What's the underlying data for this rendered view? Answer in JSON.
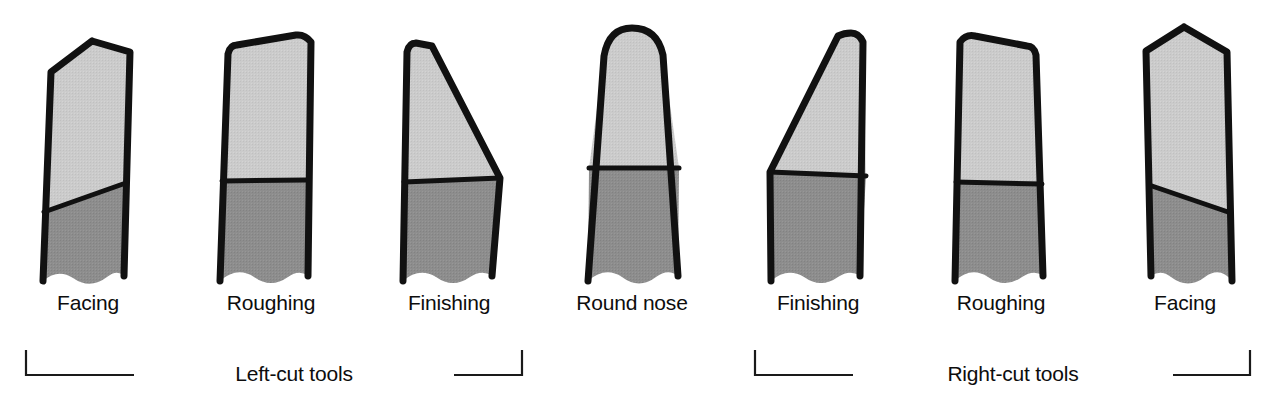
{
  "figure": {
    "background": "#ffffff",
    "outline_color": "#111111",
    "carbide_tip_color": "#c9c9c9",
    "shank_color": "#8d8d8d",
    "bracket_color": "#1a1a1a"
  },
  "tools": [
    {
      "id": "tool-1",
      "label": "Facing",
      "hand": "left-cut",
      "label_center_x": 88,
      "label_y": 291,
      "tip_path": "M 92 41 L 51 72 L 44 212 L 123 184 L 130 52 Z",
      "shank_path": "M 44 212 L 43 281 Q 58 268 73 278 Q 90 290 107 277 Q 117 269 124 276 L 123 184 Z",
      "outline_path": "M 92 41 L 51 72 L 43 281 M 92 41 L 130 52 L 124 276",
      "split_path": "M 44 212 L 123 184"
    },
    {
      "id": "tool-2",
      "label": "Roughing",
      "hand": "left-cut",
      "label_center_x": 271,
      "label_y": 291,
      "tip_path": "M 237 45 Q 230 45 228 54 L 222 181 L 307 180 L 311 42 Q 305 34 296 35 Z",
      "shank_path": "M 222 181 L 220 281 Q 237 266 254 277 Q 271 289 288 277 Q 299 269 308 276 L 307 180 Z",
      "outline_path": "M 237 45 Q 230 45 228 54 L 220 281 M 237 45 L 296 35 Q 305 34 311 42 L 308 276",
      "split_path": "M 222 181 L 307 180"
    },
    {
      "id": "tool-3",
      "label": "Finishing",
      "hand": "left-cut",
      "label_center_x": 449,
      "label_y": 291,
      "tip_path": "M 416 43 Q 409 43 407 52 L 404 182 L 500 178 L 432 46 Z",
      "shank_path": "M 404 182 L 403 281 Q 419 267 436 277 Q 453 289 470 277 Q 482 269 492 276 L 500 178 Z",
      "outline_path": "M 416 43 Q 409 43 407 52 L 403 281 M 416 43 L 432 46 L 500 178 L 492 276",
      "split_path": "M 404 182 L 500 178"
    },
    {
      "id": "tool-4",
      "label": "Round nose",
      "hand": "round-nose",
      "label_center_x": 632,
      "label_y": 291,
      "tip_path": "M 632 28 Q 609 28 604 56 L 589 168 L 679 168 L 663 55 Q 657 28 632 28 Z",
      "shank_path": "M 589 168 L 588 281 Q 605 266 622 277 Q 639 290 656 277 Q 668 268 678 276 L 679 168 Z",
      "outline_path": "M 632 28 Q 609 28 604 56 L 588 281 M 632 28 Q 657 28 663 55 L 678 276",
      "split_path": "M 589 168 L 679 168"
    },
    {
      "id": "tool-5",
      "label": "Finishing",
      "hand": "right-cut",
      "label_center_x": 818,
      "label_y": 291,
      "tip_path": "M 851 33 Q 844 33 838 36 L 770 172 L 866 176 L 863 42 Q 859 33 851 33 Z",
      "shank_path": "M 770 172 L 771 281 Q 787 267 804 277 Q 821 289 838 277 Q 850 269 860 276 L 866 176 Z",
      "outline_path": "M 851 33 Q 844 33 838 36 L 770 172 L 771 281 M 851 33 Q 859 33 863 42 L 860 276",
      "split_path": "M 770 172 L 866 176"
    },
    {
      "id": "tool-6",
      "label": "Roughing",
      "hand": "right-cut",
      "label_center_x": 1001,
      "label_y": 291,
      "tip_path": "M 975 36 Q 966 34 960 42 L 956 182 L 1042 184 L 1036 55 Q 1034 46 1027 46 Z",
      "shank_path": "M 956 182 L 955 281 Q 971 266 988 277 Q 1005 289 1022 277 Q 1034 269 1043 276 L 1042 184 Z",
      "outline_path": "M 975 36 Q 966 34 960 42 L 955 281 M 975 36 L 1027 46 Q 1034 46 1036 55 L 1043 276",
      "split_path": "M 956 182 L 1042 184"
    },
    {
      "id": "tool-7",
      "label": "Facing",
      "hand": "right-cut",
      "label_center_x": 1185,
      "label_y": 291,
      "tip_path": "M 1184 27 L 1146 51 L 1152 186 L 1231 213 L 1227 52 Z",
      "shank_path": "M 1152 186 L 1151 276 Q 1161 269 1171 277 Q 1188 290 1205 277 Q 1220 266 1232 281 L 1231 213 Z",
      "outline_path": "M 1184 27 L 1146 51 L 1151 276 M 1184 27 L 1227 52 L 1232 281",
      "split_path": "M 1152 186 L 1231 213"
    }
  ],
  "groups": [
    {
      "id": "left-cut-group",
      "label": "Left-cut tools",
      "label_center_x": 284,
      "label_y": 362,
      "bracket_x1": 26,
      "bracket_x2": 522,
      "bracket_y": 375,
      "tick_height": 25
    },
    {
      "id": "right-cut-group",
      "label": "Right-cut tools",
      "label_center_x": 1003,
      "label_y": 362,
      "bracket_x1": 755,
      "bracket_x2": 1250,
      "bracket_y": 375,
      "tick_height": 25
    }
  ]
}
